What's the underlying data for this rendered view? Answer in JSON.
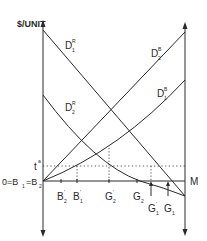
{
  "diagram": {
    "y_axis_label": "$/UNIT",
    "right_axis_label": "M",
    "origin_label": "0=B",
    "origin_sub1": "1",
    "origin_mid": "=B",
    "origin_sub2": "2",
    "t_label": "t",
    "t_sup": "a",
    "curves": [
      {
        "name": "D",
        "sub": "1",
        "sup": "R"
      },
      {
        "name": "D",
        "sub": "2",
        "sup": "R"
      },
      {
        "name": "D",
        "sub": "2",
        "sup": "B"
      },
      {
        "name": "D",
        "sub": "1",
        "sup": "B"
      }
    ],
    "x_ticks": [
      {
        "name": "B",
        "sub": "2",
        "prime": "'"
      },
      {
        "name": "B",
        "sub": "1",
        "prime": "'"
      },
      {
        "name": "G",
        "sub": "2",
        "prime": "'"
      },
      {
        "name": "G",
        "sub": "2",
        "prime": ""
      },
      {
        "name": "G",
        "sub": "1",
        "prime": "'"
      },
      {
        "name": "G",
        "sub": "1",
        "prime": ""
      }
    ],
    "colors": {
      "line": "#2a2a2a",
      "background": "#ffffff"
    }
  }
}
